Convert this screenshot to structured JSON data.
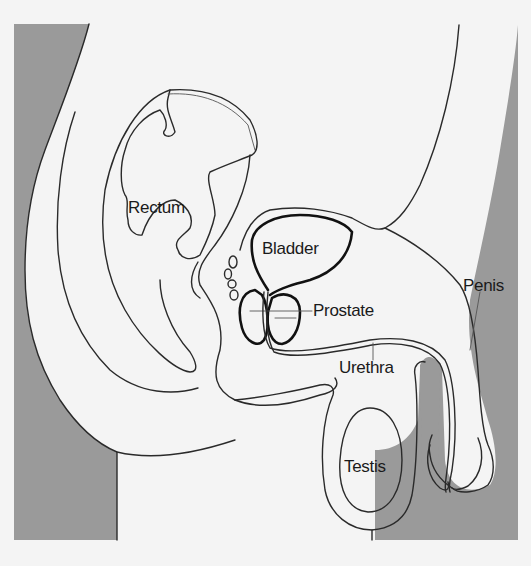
{
  "colors": {
    "background": "#f4f4f4",
    "shading": "#9a9a9a",
    "outline": "#2a2a2a"
  },
  "labels": {
    "rectum": "Rectum",
    "bladder": "Bladder",
    "prostate": "Prostate",
    "urethra": "Urethra",
    "penis": "Penis",
    "testis": "Testis"
  }
}
